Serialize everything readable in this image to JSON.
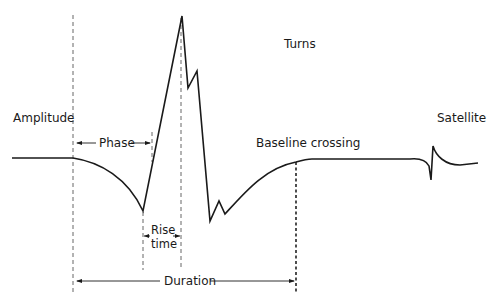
{
  "diagram": {
    "type": "motor unit action potential waveform",
    "labels": {
      "amplitude": "Amplitude",
      "phase": "Phase",
      "turns": "Turns",
      "baseline_crossing": "Baseline crossing",
      "satellite": "Satellite",
      "rise": "Rise",
      "time": "time",
      "duration": "Duration"
    },
    "colors": {
      "line": "#1a1a1a",
      "dashed": "#555555",
      "background": "#ffffff"
    }
  }
}
